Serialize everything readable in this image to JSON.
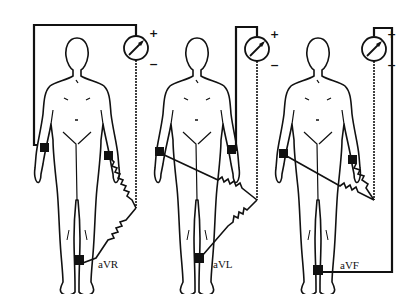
{
  "figure": {
    "panels": [
      {
        "id": "avr",
        "label": "aVR",
        "positive_electrode": "right arm",
        "plus": "+",
        "minus": "−"
      },
      {
        "id": "avl",
        "label": "aVL",
        "positive_electrode": "left arm",
        "plus": "+",
        "minus": "−"
      },
      {
        "id": "avf",
        "label": "aVF",
        "positive_electrode": "left leg",
        "plus": "+",
        "minus": "−"
      }
    ],
    "colors": {
      "ink": "#111111",
      "background": "#ffffff"
    }
  }
}
